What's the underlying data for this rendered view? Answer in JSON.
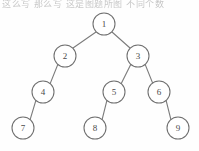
{
  "figure": {
    "type": "binary-tree-diagram",
    "top_text": "这么写 那么写 这是图题所图 不同个数",
    "background_color": "#fefefe",
    "line_color": "#7b7b7b",
    "node_fill": "#ffffff",
    "node_stroke": "#6f6f6f",
    "label_color": "#4a4a4a",
    "node_radius": 11
  },
  "tree": {
    "root": "1",
    "nodes": [
      {
        "id": "n1",
        "label": "1",
        "cx": 104,
        "cy": 24
      },
      {
        "id": "n2",
        "label": "2",
        "cx": 65,
        "cy": 56
      },
      {
        "id": "n3",
        "label": "3",
        "cx": 138,
        "cy": 56
      },
      {
        "id": "n4",
        "label": "4",
        "cx": 43,
        "cy": 92
      },
      {
        "id": "n5",
        "label": "5",
        "cx": 114,
        "cy": 92
      },
      {
        "id": "n6",
        "label": "6",
        "cx": 159,
        "cy": 92
      },
      {
        "id": "n7",
        "label": "7",
        "cx": 23,
        "cy": 128
      },
      {
        "id": "n8",
        "label": "8",
        "cx": 95,
        "cy": 128
      },
      {
        "id": "n9",
        "label": "9",
        "cx": 178,
        "cy": 128
      }
    ],
    "edges": [
      {
        "id": "e1-2",
        "from": "1",
        "to": "2",
        "side": "left",
        "x1": 96,
        "y1": 32,
        "x2": 73,
        "y2": 48
      },
      {
        "id": "e1-3",
        "from": "1",
        "to": "3",
        "side": "right",
        "x1": 112,
        "y1": 32,
        "x2": 130,
        "y2": 48
      },
      {
        "id": "e2-4",
        "from": "2",
        "to": "4",
        "side": "left",
        "x1": 58,
        "y1": 64,
        "x2": 50,
        "y2": 84
      },
      {
        "id": "e3-5",
        "from": "3",
        "to": "5",
        "side": "left",
        "x1": 131,
        "y1": 64,
        "x2": 121,
        "y2": 84
      },
      {
        "id": "e3-6",
        "from": "3",
        "to": "6",
        "side": "right",
        "x1": 145,
        "y1": 64,
        "x2": 153,
        "y2": 84
      },
      {
        "id": "e4-7",
        "from": "4",
        "to": "7",
        "side": "left",
        "x1": 36,
        "y1": 100,
        "x2": 30,
        "y2": 120
      },
      {
        "id": "e5-8",
        "from": "5",
        "to": "8",
        "side": "left",
        "x1": 107,
        "y1": 100,
        "x2": 102,
        "y2": 120
      },
      {
        "id": "e6-9",
        "from": "6",
        "to": "9",
        "side": "right",
        "x1": 166,
        "y1": 100,
        "x2": 171,
        "y2": 120
      }
    ]
  }
}
